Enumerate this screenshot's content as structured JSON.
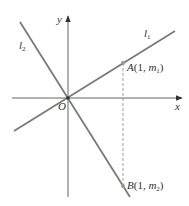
{
  "diagram": {
    "axes": {
      "x_label": "x",
      "y_label": "y",
      "origin_label": "O"
    },
    "lines": [
      {
        "name": "l1",
        "label_main": "l",
        "label_sub": "1",
        "slope_sign": "positive"
      },
      {
        "name": "l2",
        "label_main": "l",
        "label_sub": "2",
        "slope_sign": "negative"
      }
    ],
    "points": [
      {
        "name": "A",
        "label_letter": "A",
        "label_open": "(1, ",
        "label_m": "m",
        "label_sub": "1",
        "label_close": ")"
      },
      {
        "name": "B",
        "label_letter": "B",
        "label_open": "(1, ",
        "label_m": "m",
        "label_sub": "2",
        "label_close": ")"
      }
    ],
    "colors": {
      "line": "#7a7a7a",
      "axis": "#666666",
      "text": "#333333",
      "point": "#999999"
    }
  }
}
